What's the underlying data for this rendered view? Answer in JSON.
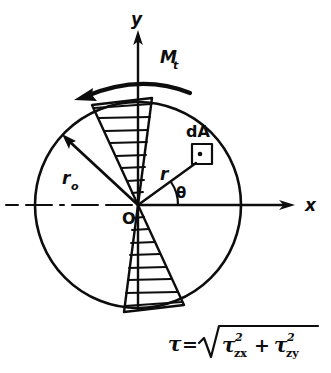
{
  "figure": {
    "stroke_color": "#0d0d0d",
    "background_color": "#ffffff",
    "axes": {
      "x_label": "x",
      "y_label": "y",
      "origin_label": "O",
      "centerline_style": "dash-dot"
    },
    "labels": {
      "torque": "M",
      "torque_sub": "t",
      "outer_radius": "r",
      "outer_radius_sub": "o",
      "radius": "r",
      "angle": "θ",
      "area_element": "dA"
    },
    "formula": {
      "lhs": "τ",
      "equals": "=",
      "radicand_term1": "τ",
      "term1_sub": "zx",
      "term1_sup": "2",
      "plus": "+",
      "radicand_term2": "τ",
      "term2_sub": "zy",
      "term2_sup": "2",
      "plain": "τ = √(τ²zx + τ²zy)"
    },
    "geometry": {
      "origin_x": 138,
      "origin_y": 205,
      "circle_radius": 103,
      "theta_degrees": 35,
      "outer_radius_angle_degrees": 135,
      "upper_wedge_hatch_lines": 8,
      "lower_wedge_hatch_lines": 8,
      "torque_direction": "counterclockwise"
    }
  }
}
